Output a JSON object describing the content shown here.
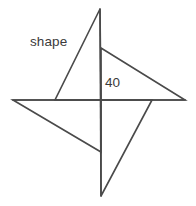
{
  "figure": {
    "background_color": "#ffffff",
    "stroke_color": "#4a4a4a",
    "text_color": "#3b3b3b",
    "width": 196,
    "height": 206
  },
  "labels": {
    "shape": "shape",
    "angle": "40"
  },
  "chart_data": {
    "type": "diagram",
    "center": {
      "x": 101,
      "y": 100
    },
    "points": {
      "top_apex": {
        "x": 100,
        "y": 9
      },
      "left_apex": {
        "x": 13,
        "y": 100
      },
      "right_apex": {
        "x": 185,
        "y": 100
      },
      "bottom_apex": {
        "x": 101,
        "y": 196
      },
      "inner_top": {
        "x": 101,
        "y": 48
      },
      "inner_left": {
        "x": 55,
        "y": 100
      },
      "inner_right": {
        "x": 152,
        "y": 100
      },
      "inner_bottom": {
        "x": 101,
        "y": 152
      }
    },
    "blades": [
      {
        "name": "upper-left-blade",
        "vertices": [
          "top_apex",
          "inner_left",
          "center"
        ],
        "path": "M 100 9 L 55 100 L 101 100 Z"
      },
      {
        "name": "upper-right-blade",
        "vertices": [
          "inner_top",
          "right_apex",
          "center"
        ],
        "path": "M 101 48 L 185 100 L 101 100 Z"
      },
      {
        "name": "lower-right-blade",
        "vertices": [
          "inner_right",
          "bottom_apex",
          "center"
        ],
        "path": "M 152 100 L 101 196 L 101 100 Z"
      },
      {
        "name": "lower-left-blade",
        "vertices": [
          "left_apex",
          "inner_bottom",
          "center"
        ],
        "path": "M 13 100 L 101 152 L 101 100 Z"
      }
    ],
    "construction_lines": [
      {
        "name": "vertical-axis",
        "from": "top_apex",
        "to": "bottom_apex",
        "path": "M 100 9 L 101 196"
      },
      {
        "name": "horizontal-axis",
        "from": "left_apex",
        "to": "right_apex",
        "path": "M 13 100 L 185 100"
      }
    ],
    "annotations": [
      {
        "name": "shape-label",
        "text": "shape",
        "x": 30,
        "y": 34,
        "refers_to": "upper-left-blade"
      },
      {
        "name": "angle-label",
        "text": "40",
        "x": 105,
        "y": 75,
        "refers_to": "angle at center between vertical axis and upper-right blade edge",
        "unit": "degrees"
      }
    ]
  }
}
